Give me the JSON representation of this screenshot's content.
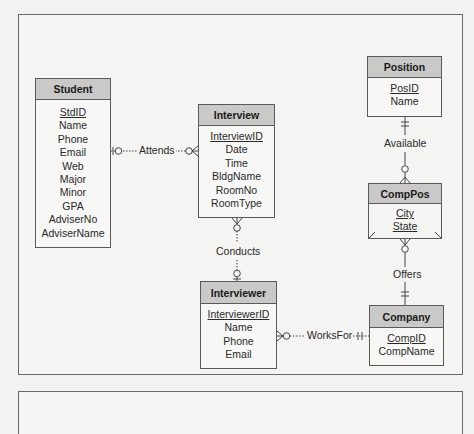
{
  "diagram": {
    "type": "entity-relationship",
    "notation": "crow's foot",
    "entities": [
      {
        "id": "student",
        "name": "Student",
        "attributes": [
          {
            "name": "StdID",
            "pk": true
          },
          {
            "name": "Name"
          },
          {
            "name": "Phone"
          },
          {
            "name": "Email"
          },
          {
            "name": "Web"
          },
          {
            "name": "Major"
          },
          {
            "name": "Minor"
          },
          {
            "name": "GPA"
          },
          {
            "name": "AdviserNo"
          },
          {
            "name": "AdviserName"
          }
        ]
      },
      {
        "id": "interview",
        "name": "Interview",
        "attributes": [
          {
            "name": "InterviewID",
            "pk": true
          },
          {
            "name": "Date"
          },
          {
            "name": "Time"
          },
          {
            "name": "BldgName"
          },
          {
            "name": "RoomNo"
          },
          {
            "name": "RoomType"
          }
        ]
      },
      {
        "id": "position",
        "name": "Position",
        "attributes": [
          {
            "name": "PosID",
            "pk": true
          },
          {
            "name": "Name"
          }
        ]
      },
      {
        "id": "comppos",
        "name": "CompPos",
        "weak": true,
        "attributes": [
          {
            "name": "City",
            "pk": true
          },
          {
            "name": "State",
            "pk": true
          }
        ]
      },
      {
        "id": "interviewer",
        "name": "Interviewer",
        "attributes": [
          {
            "name": "InterviewerID",
            "pk": true
          },
          {
            "name": "Name"
          },
          {
            "name": "Phone"
          },
          {
            "name": "Email"
          }
        ]
      },
      {
        "id": "company",
        "name": "Company",
        "attributes": [
          {
            "name": "CompID",
            "pk": true
          },
          {
            "name": "CompName"
          }
        ]
      }
    ],
    "relationships": [
      {
        "name": "Attends",
        "from": "Student",
        "to": "Interview",
        "from_card": "zero-or-one",
        "to_card": "zero-or-many",
        "style": "dotted"
      },
      {
        "name": "Conducts",
        "from": "Interviewer",
        "to": "Interview",
        "from_card": "zero-or-one",
        "to_card": "zero-or-many",
        "style": "dotted"
      },
      {
        "name": "WorksFor",
        "from": "Company",
        "to": "Interviewer",
        "from_card": "exactly-one",
        "to_card": "zero-or-many",
        "style": "dotted"
      },
      {
        "name": "Available",
        "from": "Position",
        "to": "CompPos",
        "from_card": "exactly-one",
        "to_card": "zero-or-many",
        "style": "solid"
      },
      {
        "name": "Offers",
        "from": "Company",
        "to": "CompPos",
        "from_card": "exactly-one",
        "to_card": "zero-or-many",
        "style": "solid"
      }
    ]
  },
  "labels": {
    "student": "Student",
    "student_attrs": [
      "StdID",
      "Name",
      "Phone",
      "Email",
      "Web",
      "Major",
      "Minor",
      "GPA",
      "AdviserNo",
      "AdviserName"
    ],
    "interview": "Interview",
    "interview_attrs": [
      "InterviewID",
      "Date",
      "Time",
      "BldgName",
      "RoomNo",
      "RoomType"
    ],
    "position": "Position",
    "position_attrs": [
      "PosID",
      "Name"
    ],
    "comppos": "CompPos",
    "comppos_attrs": [
      "City",
      "State"
    ],
    "interviewer": "Interviewer",
    "interviewer_attrs": [
      "InterviewerID",
      "Name",
      "Phone",
      "Email"
    ],
    "company": "Company",
    "company_attrs": [
      "CompID",
      "CompName"
    ],
    "rel_attends": "Attends",
    "rel_conducts": "Conducts",
    "rel_worksfor": "WorksFor",
    "rel_available": "Available",
    "rel_offers": "Offers"
  },
  "colors": {
    "header_fill": "#c9c9c7",
    "body_fill": "#f7f7f5",
    "border": "#5a5a5a",
    "background": "#f4f4f2"
  }
}
